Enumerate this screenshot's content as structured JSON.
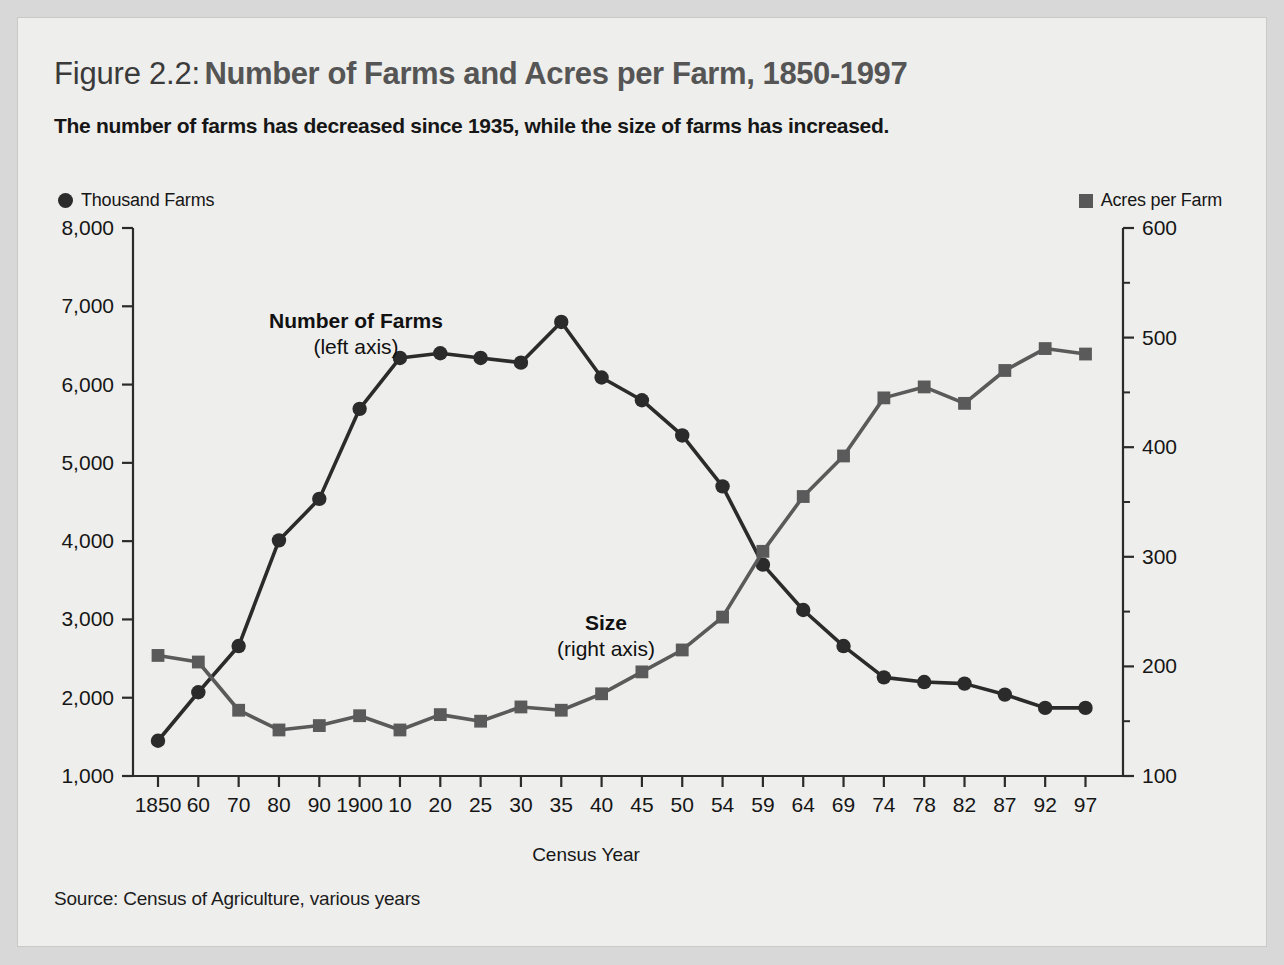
{
  "figure": {
    "label": "Figure 2.2:",
    "title": "Number of Farms and Acres per Farm, 1850-1997",
    "subtitle": "The number of farms has decreased since 1935, while the size of farms has increased.",
    "source": "Source: Census of Agriculture, various years",
    "background_color": "#eeeeec",
    "page_color": "#d8d8d8"
  },
  "legend": {
    "position": "above-plot",
    "left": {
      "marker": "circle-marker-icon",
      "label": "Thousand Farms",
      "color": "#2b2b2b"
    },
    "right": {
      "marker": "square-marker-icon",
      "label": "Acres per Farm",
      "color": "#585858"
    }
  },
  "annotations": {
    "farms": {
      "title": "Number of Farms",
      "sub": "(left axis)"
    },
    "size": {
      "title": "Size",
      "sub": "(right axis)"
    }
  },
  "chart_data": {
    "type": "line",
    "title": "Number of Farms and Acres per Farm, 1850-1997",
    "subtitle": "The number of farms has decreased since 1935, while the size of farms has increased.",
    "xlabel": "Census Year",
    "grid": false,
    "legend_position": "top",
    "categories": [
      "1850",
      "60",
      "70",
      "80",
      "90",
      "1900",
      "10",
      "20",
      "25",
      "30",
      "35",
      "40",
      "45",
      "50",
      "54",
      "59",
      "64",
      "69",
      "74",
      "78",
      "82",
      "87",
      "92",
      "97"
    ],
    "axes": {
      "left": {
        "label": "Thousand Farms",
        "ylim": [
          1000,
          8000
        ],
        "ticks": [
          "1,000",
          "2,000",
          "3,000",
          "4,000",
          "5,000",
          "6,000",
          "7,000",
          "8,000"
        ],
        "tick_values": [
          1000,
          2000,
          3000,
          4000,
          5000,
          6000,
          7000,
          8000
        ]
      },
      "right": {
        "label": "Acres per Farm",
        "ylim": [
          100,
          600
        ],
        "ticks": [
          "100",
          "200",
          "300",
          "400",
          "500",
          "600"
        ],
        "tick_values": [
          100,
          200,
          300,
          400,
          500,
          600
        ],
        "minor_tick_values": [
          150,
          250,
          350,
          450,
          550
        ]
      }
    },
    "series": [
      {
        "name": "Number of Farms",
        "unit": "thousand farms",
        "axis": "left",
        "marker": "circle",
        "color": "#2b2b2b",
        "values": [
          1450,
          2070,
          2660,
          4010,
          4540,
          5690,
          6340,
          6400,
          6340,
          6280,
          6800,
          6090,
          5800,
          5350,
          4700,
          3700,
          3120,
          2660,
          2260,
          2200,
          2180,
          2040,
          1870,
          1870
        ]
      },
      {
        "name": "Size",
        "unit": "acres per farm",
        "axis": "right",
        "marker": "square",
        "color": "#5a5a5a",
        "values": [
          210,
          204,
          160,
          142,
          146,
          155,
          142,
          156,
          150,
          163,
          160,
          175,
          195,
          215,
          245,
          305,
          355,
          392,
          445,
          455,
          440,
          470,
          490,
          485
        ]
      }
    ]
  }
}
